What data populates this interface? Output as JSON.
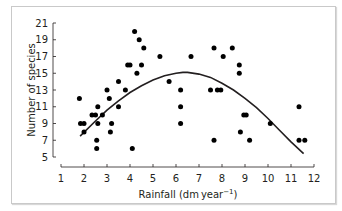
{
  "chart_data": {
    "type": "scatter",
    "title": "",
    "xlabel": "Rainfall (dm year⁻¹)",
    "xlabel_main": "Rainfall (dm year",
    "xlabel_sup": "−1",
    "xlabel_close": ")",
    "ylabel": "Number of species",
    "xlim": [
      1,
      12
    ],
    "ylim": [
      5,
      21
    ],
    "xticks": [
      1,
      2,
      3,
      4,
      5,
      6,
      7,
      8,
      9,
      10,
      11,
      12
    ],
    "yticks": [
      5,
      7,
      9,
      11,
      13,
      15,
      17,
      19,
      21
    ],
    "grid": false,
    "legend": null,
    "series": [
      {
        "name": "observations",
        "kind": "scatter",
        "points": [
          [
            1.8,
            12
          ],
          [
            1.85,
            9
          ],
          [
            2.0,
            9
          ],
          [
            2.0,
            8
          ],
          [
            2.35,
            10
          ],
          [
            2.5,
            10
          ],
          [
            2.6,
            11
          ],
          [
            2.8,
            10
          ],
          [
            2.6,
            9
          ],
          [
            2.55,
            7
          ],
          [
            2.55,
            6
          ],
          [
            3.0,
            13
          ],
          [
            3.1,
            12
          ],
          [
            3.2,
            9
          ],
          [
            3.15,
            8
          ],
          [
            3.5,
            14
          ],
          [
            3.5,
            11
          ],
          [
            3.8,
            13
          ],
          [
            3.9,
            16
          ],
          [
            4.0,
            16
          ],
          [
            4.1,
            6
          ],
          [
            4.2,
            20
          ],
          [
            4.3,
            15
          ],
          [
            4.4,
            19
          ],
          [
            4.5,
            16
          ],
          [
            4.6,
            18
          ],
          [
            5.3,
            17
          ],
          [
            5.7,
            14
          ],
          [
            6.2,
            13
          ],
          [
            6.2,
            11
          ],
          [
            6.2,
            9
          ],
          [
            6.65,
            17
          ],
          [
            7.5,
            13
          ],
          [
            7.65,
            18
          ],
          [
            7.65,
            7
          ],
          [
            7.8,
            13
          ],
          [
            7.95,
            13
          ],
          [
            8.05,
            17
          ],
          [
            8.45,
            18
          ],
          [
            8.75,
            16
          ],
          [
            8.75,
            15
          ],
          [
            8.8,
            8
          ],
          [
            8.95,
            10
          ],
          [
            9.05,
            10
          ],
          [
            9.2,
            7
          ],
          [
            10.1,
            9
          ],
          [
            11.35,
            11
          ],
          [
            11.35,
            7
          ],
          [
            11.6,
            7
          ]
        ]
      },
      {
        "name": "fitted quadratic",
        "kind": "line",
        "points": [
          [
            1.83,
            7.5
          ],
          [
            2.5,
            9.3
          ],
          [
            3.0,
            10.6
          ],
          [
            3.5,
            11.7
          ],
          [
            4.0,
            12.7
          ],
          [
            4.5,
            13.5
          ],
          [
            5.0,
            14.2
          ],
          [
            5.5,
            14.7
          ],
          [
            6.0,
            15.0
          ],
          [
            6.3,
            15.1
          ],
          [
            6.5,
            15.1
          ],
          [
            7.0,
            14.9
          ],
          [
            7.5,
            14.5
          ],
          [
            8.0,
            13.8
          ],
          [
            8.5,
            13.0
          ],
          [
            9.0,
            12.0
          ],
          [
            9.5,
            10.9
          ],
          [
            10.0,
            9.6
          ],
          [
            10.5,
            8.2
          ],
          [
            11.0,
            6.8
          ],
          [
            11.55,
            5.4
          ]
        ]
      }
    ]
  }
}
